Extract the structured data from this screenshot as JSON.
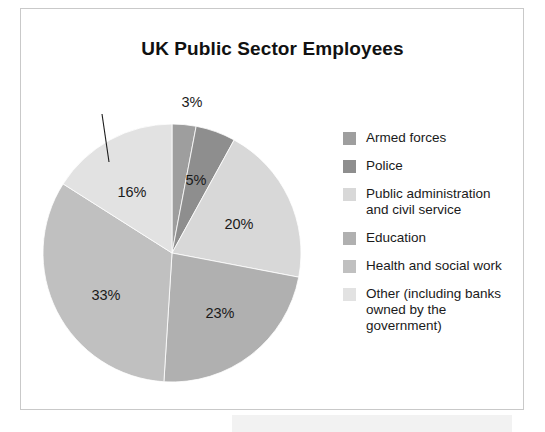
{
  "chart_title": "UK Public Sector Employees",
  "chart_data": {
    "type": "pie",
    "title": "UK Public Sector Employees",
    "xlabel": "",
    "ylabel": "",
    "legend_position": "right",
    "grid": false,
    "start_angle_deg": 0,
    "direction": "clockwise",
    "unit": "%",
    "categories": [
      "Armed forces",
      "Police",
      "Public administration and civil service",
      "Education",
      "Health and social work",
      "Other (including banks owned by the government)"
    ],
    "values": [
      3,
      5,
      20,
      23,
      33,
      16
    ],
    "value_labels": [
      "3%",
      "5%",
      "20%",
      "23%",
      "33%",
      "16%"
    ],
    "colors": [
      "#9e9e9e",
      "#8e8e8e",
      "#d8d8d8",
      "#b0b0b0",
      "#c0c0c0",
      "#e2e2e2"
    ],
    "slices": [
      {
        "label": "Armed forces",
        "value": 3,
        "value_label": "3%",
        "color": "#9e9e9e",
        "label_placement": "outside-callout",
        "label_x": 192,
        "label_y": 102,
        "callout": true
      },
      {
        "label": "Police",
        "value": 5,
        "value_label": "5%",
        "color": "#8e8e8e",
        "label_placement": "inside",
        "label_x": 196,
        "label_y": 180,
        "callout": false
      },
      {
        "label": "Public administration and civil service",
        "value": 20,
        "value_label": "20%",
        "color": "#d8d8d8",
        "label_placement": "inside",
        "label_x": 239,
        "label_y": 224,
        "callout": false
      },
      {
        "label": "Education",
        "value": 23,
        "value_label": "23%",
        "color": "#b0b0b0",
        "label_placement": "inside",
        "label_x": 220,
        "label_y": 313,
        "callout": false
      },
      {
        "label": "Health and social work",
        "value": 33,
        "value_label": "33%",
        "color": "#c0c0c0",
        "label_placement": "inside",
        "label_x": 106,
        "label_y": 295,
        "callout": false
      },
      {
        "label": "Other (including banks owned by the government)",
        "value": 16,
        "value_label": "16%",
        "color": "#e2e2e2",
        "label_placement": "inside",
        "label_x": 132,
        "label_y": 192,
        "callout": false
      }
    ]
  },
  "legend": {
    "items": [
      {
        "label": "Armed forces",
        "color": "#9e9e9e"
      },
      {
        "label": "Police",
        "color": "#8e8e8e"
      },
      {
        "label": "Public administration\nand civil service",
        "color": "#d8d8d8"
      },
      {
        "label": "Education",
        "color": "#b0b0b0"
      },
      {
        "label": "Health and social work",
        "color": "#c0c0c0"
      },
      {
        "label": "Other (including banks\nowned by the\ngovernment)",
        "color": "#e2e2e2"
      }
    ]
  }
}
